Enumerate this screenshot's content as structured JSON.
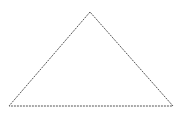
{
  "diagram": {
    "shape": "triangle",
    "stroke_color": "#555555",
    "stroke_style": "dashed",
    "dash_pattern": "2,1",
    "stroke_width": 1,
    "fill": "none",
    "vertices": {
      "apex": [
        90,
        12
      ],
      "bottom_left": [
        9,
        106
      ],
      "bottom_right": [
        173,
        106
      ]
    }
  }
}
